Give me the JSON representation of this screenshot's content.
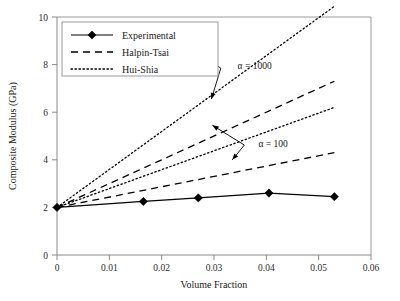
{
  "chart_data": {
    "type": "line",
    "title": "",
    "xlabel": "Volume Fraction",
    "ylabel": "Composite Modulus (GPa)",
    "xlim": [
      0,
      0.06
    ],
    "ylim": [
      0,
      10
    ],
    "xticks": [
      "0",
      "0.01",
      "0.02",
      "0.03",
      "0.04",
      "0.05",
      "0.06"
    ],
    "xtick_values": [
      0,
      0.01,
      0.02,
      0.03,
      0.04,
      0.05,
      0.06
    ],
    "yticks": [
      "0",
      "2",
      "4",
      "6",
      "8",
      "10"
    ],
    "ytick_values": [
      0,
      2,
      4,
      6,
      8,
      10
    ],
    "grid": false,
    "legend_position": "upper-left",
    "series": [
      {
        "name": "Experimental",
        "style": "solid",
        "marker": "diamond",
        "x": [
          0,
          0.0165,
          0.027,
          0.0405,
          0.053
        ],
        "y": [
          2.0,
          2.25,
          2.4,
          2.6,
          2.45
        ]
      },
      {
        "name": "Hui-Shia, alpha = 1000",
        "style": "dotted",
        "marker": "none",
        "x": [
          0,
          0.053
        ],
        "y": [
          2.0,
          10.45
        ]
      },
      {
        "name": "Halpin-Tsai, alpha = 1000",
        "style": "dashed",
        "marker": "none",
        "x": [
          0,
          0.053
        ],
        "y": [
          2.0,
          7.3
        ]
      },
      {
        "name": "Hui-Shia, alpha = 100",
        "style": "dotted",
        "marker": "none",
        "x": [
          0,
          0.053
        ],
        "y": [
          2.0,
          6.2
        ]
      },
      {
        "name": "Halpin-Tsai, alpha = 100",
        "style": "dashed",
        "marker": "none",
        "x": [
          0,
          0.053
        ],
        "y": [
          2.0,
          4.3
        ]
      }
    ],
    "annotations": [
      {
        "text": "α = 1000",
        "text_x": 0.0345,
        "text_y": 7.95,
        "elbow_x": 0.0313,
        "elbow_y": 7.85,
        "targets": [
          {
            "x": 0.02625,
            "y": 8.6
          },
          {
            "x": 0.0295,
            "y": 6.55
          }
        ]
      },
      {
        "text": "α = 100",
        "text_x": 0.0385,
        "text_y": 4.7,
        "elbow_x": 0.0358,
        "elbow_y": 4.62,
        "targets": [
          {
            "x": 0.0297,
            "y": 5.45
          },
          {
            "x": 0.0335,
            "y": 4.0
          }
        ]
      }
    ],
    "legend": [
      {
        "label": "Experimental",
        "style": "solid",
        "marker": "diamond"
      },
      {
        "label": "Halpin-Tsai",
        "style": "dashed",
        "marker": "none"
      },
      {
        "label": "Hui-Shia",
        "style": "dotted",
        "marker": "none"
      }
    ]
  }
}
